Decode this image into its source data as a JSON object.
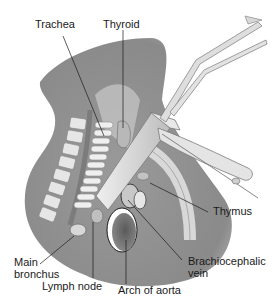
{
  "figure": {
    "labels": {
      "trachea": "Trachea",
      "thyroid": "Thyroid",
      "thymus": "Thymus",
      "main_bronchus_line1": "Main",
      "main_bronchus_line2": "bronchus",
      "lymph_node": "Lymph node",
      "arch_of_aorta": "Arch of aorta",
      "brachiocephalic_line1": "Brachiocephalic",
      "brachiocephalic_line2": "vein"
    },
    "colors": {
      "tissue": "#8f8f8f",
      "tissue_light": "#b5b5b5",
      "bone": "#e4e4e4",
      "instrument": "#dcdcdc",
      "instrument_edge": "#7a7a7a",
      "leader_line": "#1a1a1a"
    }
  }
}
